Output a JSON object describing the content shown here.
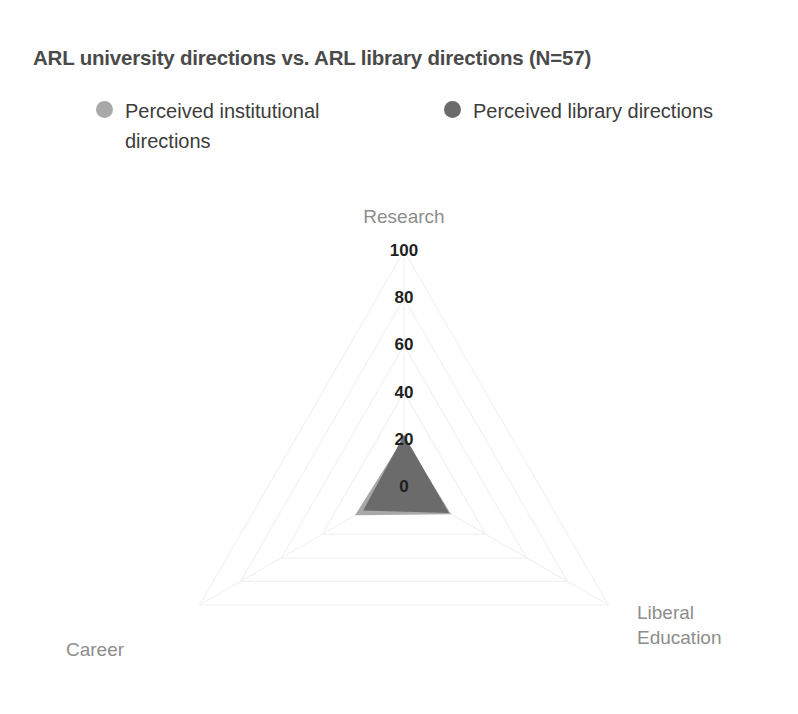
{
  "chart_data": {
    "type": "radar",
    "title": "ARL university directions vs. ARL library directions (N=57)",
    "categories": [
      "Research",
      "Liberal Education",
      "Career"
    ],
    "tick_labels": [
      "0",
      "20",
      "40",
      "60",
      "80",
      "100"
    ],
    "ticks": [
      0,
      20,
      40,
      60,
      80,
      100
    ],
    "rlim": [
      0,
      100
    ],
    "grid": true,
    "legend_position": "top",
    "series": [
      {
        "name": "Perceived institutional directions",
        "color": "#a8a8a8",
        "values": [
          21,
          23,
          24
        ]
      },
      {
        "name": "Perceived library directions",
        "color": "#6b6b6b",
        "values": [
          22,
          22,
          20
        ]
      }
    ]
  },
  "title": {
    "text": "ARL university directions vs. ARL library directions (N=57)"
  },
  "legend": {
    "items": [
      {
        "label": "Perceived institutional directions",
        "color": "#a8a8a8"
      },
      {
        "label": "Perceived library directions",
        "color": "#6b6b6b"
      }
    ]
  },
  "axes": {
    "research": "Research",
    "liberal_education_line1": "Liberal",
    "liberal_education_line2": "Education",
    "career": "Career"
  },
  "ticks": {
    "t0": "0",
    "t20": "20",
    "t40": "40",
    "t60": "60",
    "t80": "80",
    "t100": "100"
  },
  "colors": {
    "series_institutional": "#a8a8a8",
    "series_library": "#6b6b6b",
    "grid": "#f2f2f2",
    "title_text": "#4a4a4a",
    "axis_text": "#8d8d8d",
    "tick_text": "#1f1f1f",
    "background": "#ffffff"
  }
}
